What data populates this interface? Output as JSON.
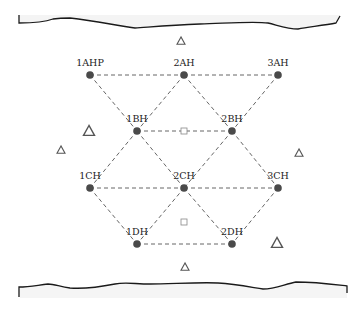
{
  "diagram": {
    "type": "borehole-layout-plan",
    "colors": {
      "node": "#4a4a4a",
      "edge": "#666666",
      "boundary": "#1a1a1a",
      "marker": "#555555"
    },
    "nodes": [
      {
        "id": "1AHP",
        "label": "1AHP",
        "x": 90,
        "y": 75
      },
      {
        "id": "2AH",
        "label": "2AH",
        "x": 184,
        "y": 75
      },
      {
        "id": "3AH",
        "label": "3AH",
        "x": 278,
        "y": 75
      },
      {
        "id": "1BH",
        "label": "1BH",
        "x": 137,
        "y": 131
      },
      {
        "id": "2BH",
        "label": "2BH",
        "x": 232,
        "y": 131
      },
      {
        "id": "1CH",
        "label": "1CH",
        "x": 90,
        "y": 188
      },
      {
        "id": "2CH",
        "label": "2CH",
        "x": 184,
        "y": 188
      },
      {
        "id": "3CH",
        "label": "3CH",
        "x": 278,
        "y": 188
      },
      {
        "id": "1DH",
        "label": "1DH",
        "x": 137,
        "y": 244
      },
      {
        "id": "2DH",
        "label": "2DH",
        "x": 232,
        "y": 244
      }
    ],
    "edges": [
      [
        "1AHP",
        "2AH"
      ],
      [
        "2AH",
        "3AH"
      ],
      [
        "1AHP",
        "1BH"
      ],
      [
        "2AH",
        "1BH"
      ],
      [
        "2AH",
        "2BH"
      ],
      [
        "3AH",
        "2BH"
      ],
      [
        "1BH",
        "2BH"
      ],
      [
        "1BH",
        "1CH"
      ],
      [
        "1BH",
        "2CH"
      ],
      [
        "2BH",
        "2CH"
      ],
      [
        "2BH",
        "3CH"
      ],
      [
        "1CH",
        "2CH"
      ],
      [
        "2CH",
        "3CH"
      ],
      [
        "1CH",
        "1DH"
      ],
      [
        "2CH",
        "1DH"
      ],
      [
        "2CH",
        "2DH"
      ],
      [
        "3CH",
        "2DH"
      ],
      [
        "1DH",
        "2DH"
      ]
    ],
    "square_markers": [
      {
        "x": 184,
        "y": 131
      },
      {
        "x": 184,
        "y": 222
      }
    ],
    "triangle_markers": [
      {
        "x": 181,
        "y": 41,
        "size": "small"
      },
      {
        "x": 89,
        "y": 131,
        "size": "large"
      },
      {
        "x": 61,
        "y": 150,
        "size": "small"
      },
      {
        "x": 299,
        "y": 153,
        "size": "small"
      },
      {
        "x": 277,
        "y": 243,
        "size": "large"
      },
      {
        "x": 185,
        "y": 267,
        "size": "small"
      }
    ]
  }
}
